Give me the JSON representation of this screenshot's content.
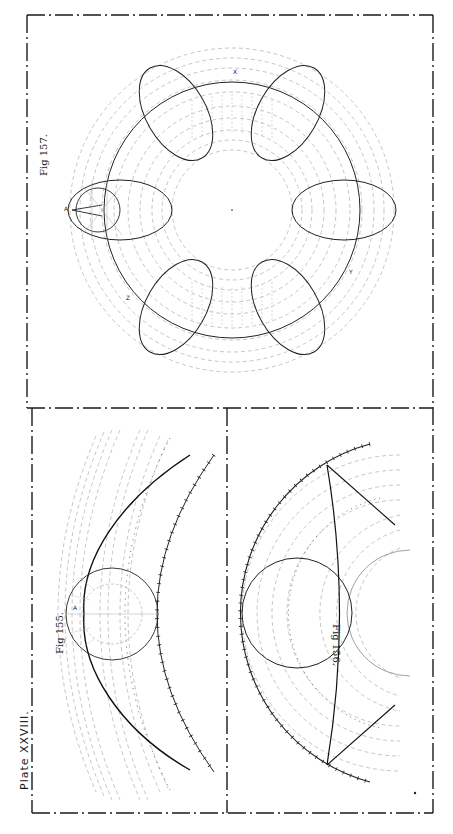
{
  "plate": {
    "title": "Plate XXVIII.",
    "ink_color": "#1a1a1a",
    "guide_color": "#9a9a9a",
    "paper_color": "#ffffff"
  },
  "figures": [
    {
      "id": "fig155",
      "label": "Fig 155.",
      "points": [
        "A"
      ],
      "description": "Rolling circle on curved rack; cycloidal curve with tick-marked pitch arcs"
    },
    {
      "id": "fig156",
      "label": "Fig 156.",
      "points": [],
      "description": "Circle rolling inside annulus; tick-marked outer arc and chord lines"
    },
    {
      "id": "fig157",
      "label": "Fig 157.",
      "points": [
        "A",
        "X",
        "Y",
        "Z"
      ],
      "description": "Six-lobed epitrochoid curve around concentric dashed guide circles"
    }
  ]
}
